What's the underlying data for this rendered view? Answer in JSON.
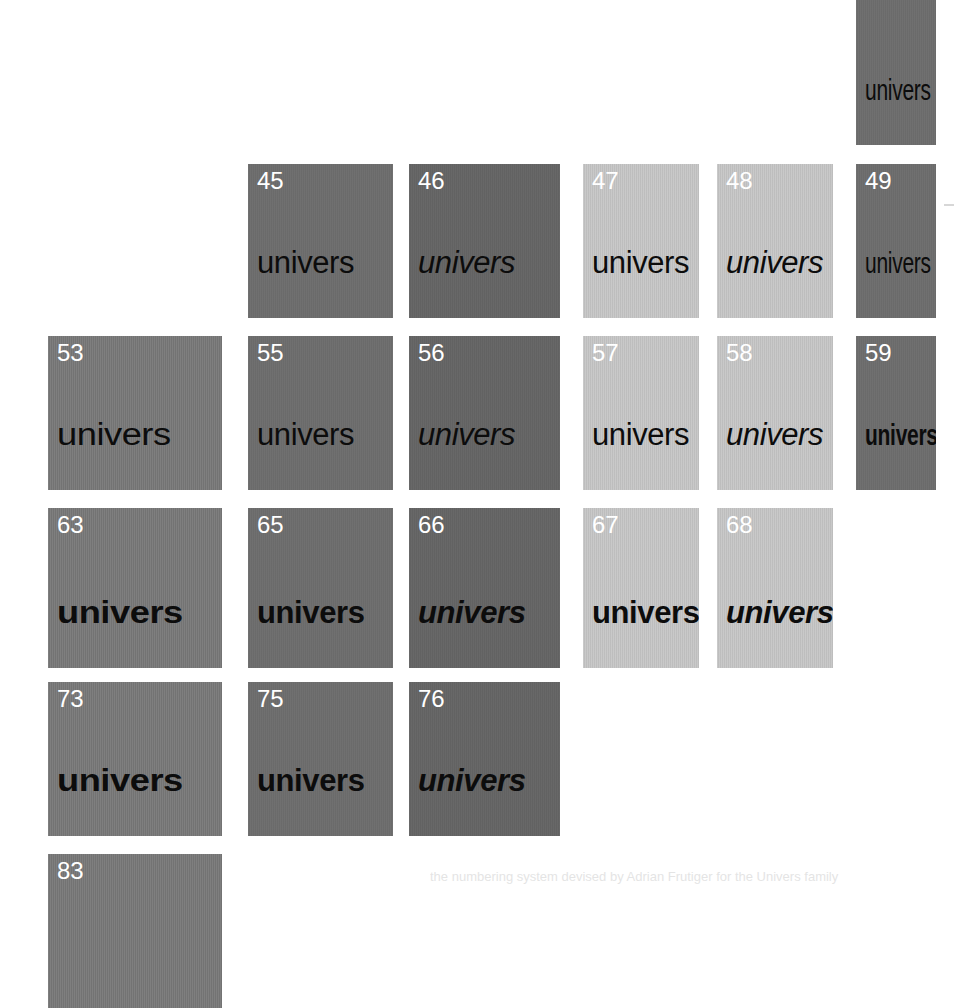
{
  "page": {
    "specimen_word": "univers",
    "background_color": "#ffffff",
    "caption_text": "the numbering system devised by Adrian Frutiger for the Univers family"
  },
  "palette": {
    "tone_dark": "#6d6d6d",
    "tone_darker": "#646464",
    "tone_mid": "#787878",
    "tone_light": "#c6c6c6",
    "number_color": "#ffffff",
    "word_color": "#0c0c0c"
  },
  "grid": {
    "rows": [
      {
        "row_label": "39",
        "cells": [
          {
            "number": "39",
            "word": "univers",
            "tone": "tone-dark",
            "weight": "w-regular",
            "italic": false,
            "width": "x-condensed",
            "col": 6,
            "cut_off_top": true
          }
        ]
      },
      {
        "row_label": "45-49",
        "cells": [
          {
            "number": "45",
            "word": "univers",
            "tone": "tone-dark",
            "weight": "w-light",
            "italic": false,
            "width": "x-normal",
            "col": 2
          },
          {
            "number": "46",
            "word": "univers",
            "tone": "tone-darker",
            "weight": "w-light",
            "italic": true,
            "width": "x-normal",
            "col": 3
          },
          {
            "number": "47",
            "word": "univers",
            "tone": "tone-light",
            "weight": "w-light",
            "italic": false,
            "width": "x-normal",
            "col": 4
          },
          {
            "number": "48",
            "word": "univers",
            "tone": "tone-light",
            "weight": "w-light",
            "italic": true,
            "width": "x-normal",
            "col": 5
          },
          {
            "number": "49",
            "word": "univers",
            "tone": "tone-dark",
            "weight": "w-regular",
            "italic": false,
            "width": "x-condensed",
            "col": 6
          }
        ]
      },
      {
        "row_label": "53-59",
        "cells": [
          {
            "number": "53",
            "word": "univers",
            "tone": "tone-mid",
            "weight": "w-regular",
            "italic": false,
            "width": "x-extended",
            "col": 1
          },
          {
            "number": "55",
            "word": "univers",
            "tone": "tone-dark",
            "weight": "w-regular",
            "italic": false,
            "width": "x-normal",
            "col": 2
          },
          {
            "number": "56",
            "word": "univers",
            "tone": "tone-darker",
            "weight": "w-regular",
            "italic": true,
            "width": "x-normal",
            "col": 3
          },
          {
            "number": "57",
            "word": "univers",
            "tone": "tone-light",
            "weight": "w-regular",
            "italic": false,
            "width": "x-normal",
            "col": 4
          },
          {
            "number": "58",
            "word": "univers",
            "tone": "tone-light",
            "weight": "w-regular",
            "italic": true,
            "width": "x-normal",
            "col": 5
          },
          {
            "number": "59",
            "word": "univers",
            "tone": "tone-dark",
            "weight": "w-bold",
            "italic": false,
            "width": "x-condensed",
            "col": 6
          }
        ]
      },
      {
        "row_label": "63-68",
        "cells": [
          {
            "number": "63",
            "word": "univers",
            "tone": "tone-mid",
            "weight": "w-bold",
            "italic": false,
            "width": "x-extended",
            "col": 1
          },
          {
            "number": "65",
            "word": "univers",
            "tone": "tone-dark",
            "weight": "w-bold",
            "italic": false,
            "width": "x-normal",
            "col": 2
          },
          {
            "number": "66",
            "word": "univers",
            "tone": "tone-darker",
            "weight": "w-bold",
            "italic": true,
            "width": "x-normal",
            "col": 3
          },
          {
            "number": "67",
            "word": "univers",
            "tone": "tone-light",
            "weight": "w-bold",
            "italic": false,
            "width": "x-normal",
            "col": 4
          },
          {
            "number": "68",
            "word": "univers",
            "tone": "tone-light",
            "weight": "w-bold",
            "italic": true,
            "width": "x-normal",
            "col": 5
          }
        ]
      },
      {
        "row_label": "73-76",
        "cells": [
          {
            "number": "73",
            "word": "univers",
            "tone": "tone-mid",
            "weight": "w-black",
            "italic": false,
            "width": "x-extended",
            "col": 1
          },
          {
            "number": "75",
            "word": "univers",
            "tone": "tone-dark",
            "weight": "w-black",
            "italic": false,
            "width": "x-normal",
            "col": 2
          },
          {
            "number": "76",
            "word": "univers",
            "tone": "tone-darker",
            "weight": "w-black",
            "italic": true,
            "width": "x-normal",
            "col": 3
          }
        ]
      },
      {
        "row_label": "83",
        "cells": [
          {
            "number": "83",
            "word": "",
            "tone": "tone-mid",
            "weight": "w-black",
            "italic": false,
            "width": "x-extended",
            "col": 1,
            "cut_off_bottom": true
          }
        ]
      }
    ]
  },
  "geometry": {
    "columns": [
      {
        "index": 1,
        "left": 48,
        "width": 174
      },
      {
        "index": 2,
        "left": 248,
        "width": 145
      },
      {
        "index": 3,
        "left": 409,
        "width": 151
      },
      {
        "index": 4,
        "left": 583,
        "width": 116
      },
      {
        "index": 5,
        "left": 717,
        "width": 116
      },
      {
        "index": 6,
        "left": 856,
        "width": 80
      }
    ],
    "rows": [
      {
        "index": 1,
        "top": -42,
        "height": 187
      },
      {
        "index": 2,
        "top": 164,
        "height": 154
      },
      {
        "index": 3,
        "top": 336,
        "height": 154
      },
      {
        "index": 4,
        "top": 508,
        "height": 160
      },
      {
        "index": 5,
        "top": 682,
        "height": 154
      },
      {
        "index": 6,
        "top": 854,
        "height": 154
      }
    ]
  }
}
